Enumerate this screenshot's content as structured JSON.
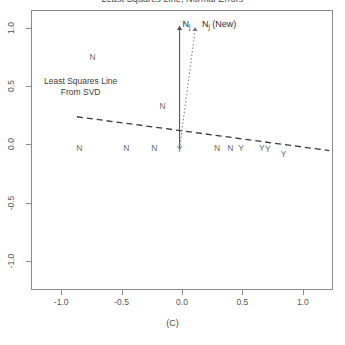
{
  "chart_data": {
    "type": "scatter",
    "title": "Least Squares Line, Normal Errors",
    "xlabel": "(C)",
    "ylabel": "",
    "xlim": [
      -1.25,
      1.25
    ],
    "ylim": [
      -1.25,
      1.15
    ],
    "grid": false,
    "legend_position": "none",
    "xticks": [
      "-1.0",
      "-0.5",
      "0.0",
      "0.5",
      "1.0"
    ],
    "xtick_values": [
      -1.0,
      -0.5,
      0.0,
      0.5,
      1.0
    ],
    "yticks": [
      "1.0",
      "0.5",
      "0.0",
      "-0.5",
      "-1.0"
    ],
    "ytick_values": [
      1.0,
      0.5,
      0.0,
      -0.5,
      -1.0
    ],
    "point_label_note": "Data points are drawn as the letters N and Y",
    "points": [
      {
        "label": "N",
        "x": -0.74,
        "y": 0.75
      },
      {
        "label": "N",
        "x": -0.16,
        "y": 0.33
      },
      {
        "label": "N",
        "x": -0.85,
        "y": -0.03
      },
      {
        "label": "N",
        "x": -0.46,
        "y": -0.03
      },
      {
        "label": "N",
        "x": -0.23,
        "y": -0.03
      },
      {
        "label": "Y",
        "x": -0.02,
        "y": -0.04
      },
      {
        "label": "N",
        "x": 0.29,
        "y": -0.03
      },
      {
        "label": "N",
        "x": 0.4,
        "y": -0.03
      },
      {
        "label": "Y",
        "x": 0.49,
        "y": -0.03
      },
      {
        "label": "Y",
        "x": 0.66,
        "y": -0.03
      },
      {
        "label": "Y",
        "x": 0.71,
        "y": -0.04
      },
      {
        "label": "Y",
        "x": 0.84,
        "y": -0.08
      }
    ],
    "least_squares_line": {
      "style": "dashed",
      "x_start": -0.87,
      "y_start": 0.235,
      "x_end": 1.22,
      "y_end": -0.055
    },
    "annotations": [
      {
        "name": "least-squares-annotation",
        "line1": "Least Squares Line",
        "line2": "From SVD",
        "x": -0.63,
        "y": 0.5
      },
      {
        "name": "nj-arrow-label",
        "text": "N",
        "subscript": "j",
        "x": -0.02,
        "y": 1.02
      },
      {
        "name": "nj-new-arrow-label",
        "text": "N",
        "subscript": "j",
        "suffix": " (New)",
        "x": 0.14,
        "y": 1.02
      }
    ],
    "arrows": [
      {
        "name": "nj-arrow",
        "style": "solid",
        "x_tail": -0.02,
        "y_tail": -0.04,
        "x_head": -0.02,
        "y_head": 1.0
      },
      {
        "name": "nj-new-arrow",
        "style": "dotted",
        "x_tail": -0.02,
        "y_tail": -0.04,
        "x_head": 0.11,
        "y_head": 0.99
      }
    ],
    "colors": {
      "axis": "#8a8a8a",
      "glyph": "#6b6b6b",
      "line": "#3a3a3a",
      "arrow": "#555555",
      "text": "#4a4a4a"
    }
  }
}
